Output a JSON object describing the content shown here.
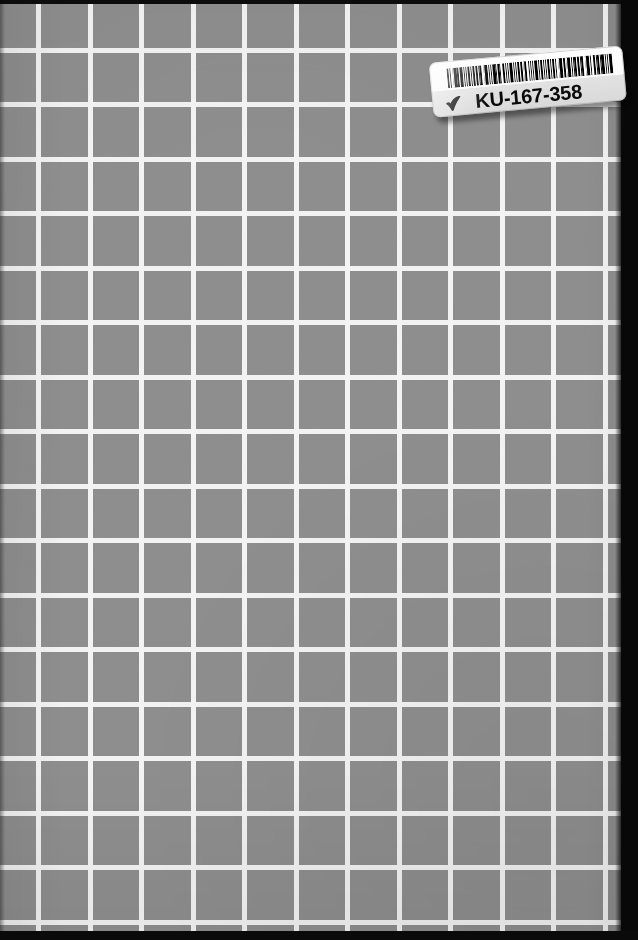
{
  "page": {
    "kind": "scanned-book-back-cover",
    "width": 638,
    "height": 940,
    "background_color": "#8e8e8e",
    "grid_line_color": "#f2f2f2",
    "edge_color": "#0a0a0a"
  },
  "grid": {
    "cell_width_px": 51.5,
    "cell_height_px": 54.5,
    "line_width_px": 5,
    "columns": 13,
    "rows": 18
  },
  "label": {
    "code_text": "KU-167-358",
    "tick_icon": "check-mark-icon",
    "barcode_symbology_label": "barcode",
    "background_color": "#fbfbfb",
    "text_color": "#0a0a0a",
    "rotation_deg": -5.2,
    "barcode_bars": [
      3,
      1,
      1,
      2,
      1,
      1,
      3,
      1,
      2,
      1,
      4,
      1,
      2,
      1,
      1,
      1,
      3,
      1,
      1,
      2,
      2,
      1,
      3,
      1,
      1,
      1,
      2,
      2,
      1,
      1,
      4,
      1,
      1,
      1,
      2,
      1,
      3,
      1,
      1,
      1,
      2,
      1,
      1,
      2,
      3,
      1,
      1,
      1,
      2,
      1,
      4,
      1,
      1,
      2,
      1,
      1,
      3,
      1,
      2,
      1,
      1,
      1,
      3,
      2,
      1,
      1,
      2,
      1,
      1,
      1,
      4,
      2,
      1,
      1,
      3,
      1,
      1,
      1,
      2,
      1,
      2,
      2,
      1,
      1,
      3,
      1,
      1,
      2,
      1,
      1,
      4,
      1,
      2,
      1,
      1,
      1,
      3,
      2,
      1,
      1,
      1,
      1,
      2,
      1,
      3,
      1,
      1,
      1,
      2,
      2,
      1,
      1,
      4,
      1,
      1,
      2,
      3,
      1,
      1,
      1,
      2,
      1,
      1,
      1,
      3,
      2,
      1,
      1,
      1,
      1,
      4,
      2
    ]
  }
}
